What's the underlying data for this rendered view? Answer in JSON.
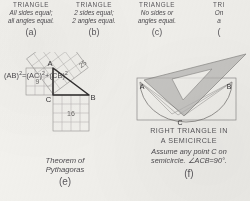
{
  "page": {
    "background_color": "#f3f2ee",
    "ink_color": "#4a4a4a"
  },
  "triangle_types": [
    {
      "heading": "TRIANGLE",
      "line1": "All sides equal;",
      "line2": "all angles equal.",
      "tag": "(a)"
    },
    {
      "heading": "TRIANGLE",
      "line1": "2 sides equal;",
      "line2": "2 angles equal.",
      "tag": "(b)"
    },
    {
      "heading": "TRIANGLE",
      "line1": "No sides or",
      "line2": "angles equal.",
      "tag": "(c)"
    },
    {
      "heading": "TRI",
      "line1": "On",
      "line2": "a",
      "tag": "("
    }
  ],
  "pythagoras": {
    "formula": "(AB)²=(AC)²+(CB)²",
    "formula_parts": {
      "ab": "(AB)",
      "ac": "(AC)",
      "cb": "(CB)",
      "exponent": "2",
      "equals": "=",
      "plus": "+"
    },
    "vertices": {
      "a": "A",
      "b": "B",
      "c": "C"
    },
    "squares": {
      "vertical_leg": {
        "label": "9",
        "grid": 3
      },
      "horizontal_leg": {
        "label": "16",
        "grid": 4
      },
      "hypotenuse": {
        "label": "25",
        "grid": 5
      }
    },
    "caption_line1": "Theorem of",
    "caption_line2": "Pythagoras",
    "tag": "(e)"
  },
  "semicircle": {
    "vertices": {
      "a": "A",
      "b": "B",
      "c": "C"
    },
    "caption_line1": "RIGHT TRIANGLE IN",
    "caption_line2": "A SEMICIRCLE",
    "sub_line1": "Assume any point C on",
    "sub_line2": "semicircle. ∠ACB=90°.",
    "tag": "(f)",
    "set_square_color": "#b9b8b6"
  }
}
